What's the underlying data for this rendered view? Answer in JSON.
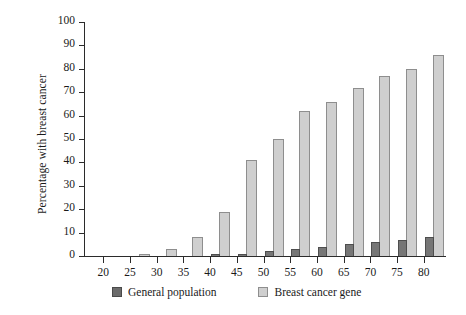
{
  "chart_data": {
    "type": "bar",
    "title": "",
    "xlabel": "",
    "ylabel": "Percentage with breast cancer",
    "categories": [
      "20",
      "25",
      "30",
      "35",
      "40",
      "45",
      "50",
      "55",
      "60",
      "65",
      "70",
      "75",
      "80"
    ],
    "ylim": [
      0,
      100
    ],
    "yticks": [
      "0",
      "10",
      "20",
      "30",
      "40",
      "50",
      "60",
      "70",
      "80",
      "90",
      "100"
    ],
    "ytick_values": [
      0,
      10,
      20,
      30,
      40,
      50,
      60,
      70,
      80,
      90,
      100
    ],
    "grid": false,
    "legend_position": "bottom",
    "series": [
      {
        "name": "General population",
        "color": "#6b6b6b",
        "values": [
          0,
          0,
          0,
          0,
          1,
          1,
          2,
          3,
          4,
          5,
          6,
          7,
          8
        ]
      },
      {
        "name": "Breast cancer gene",
        "color": "#cfcfcf",
        "values": [
          0,
          1,
          3,
          8,
          19,
          41,
          50,
          62,
          66,
          72,
          77,
          80,
          86
        ]
      }
    ]
  },
  "legend": {
    "items": [
      {
        "label": "General population",
        "swatch": "gen"
      },
      {
        "label": "Breast cancer gene",
        "swatch": "gene"
      }
    ]
  }
}
